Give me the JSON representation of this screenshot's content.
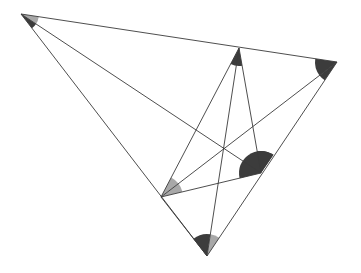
{
  "diagram": {
    "type": "geometric-construction",
    "vertices": [
      {
        "id": "A",
        "x": 21,
        "y": 14
      },
      {
        "id": "B",
        "x": 239,
        "y": 48
      },
      {
        "id": "C",
        "x": 337,
        "y": 62
      },
      {
        "id": "D",
        "x": 261,
        "y": 173
      },
      {
        "id": "E",
        "x": 161,
        "y": 197
      },
      {
        "id": "F",
        "x": 207,
        "y": 256
      }
    ],
    "edges": [
      [
        "A",
        "C"
      ],
      [
        "A",
        "F"
      ],
      [
        "A",
        "D"
      ],
      [
        "C",
        "F"
      ],
      [
        "C",
        "E"
      ],
      [
        "B",
        "E"
      ],
      [
        "B",
        "F"
      ],
      [
        "B",
        "D"
      ],
      [
        "E",
        "D"
      ],
      [
        "E",
        "F"
      ]
    ],
    "angle_marks": [
      {
        "vertex": "A",
        "between": [
          "C",
          "D"
        ],
        "shade": "light",
        "r": 18
      },
      {
        "vertex": "A",
        "between": [
          "D",
          "F"
        ],
        "shade": "dark",
        "r": 18
      },
      {
        "vertex": "B",
        "between": [
          "E",
          "D"
        ],
        "shade": "dark",
        "r": 18
      },
      {
        "vertex": "C",
        "between": [
          "A",
          "E"
        ],
        "shade": "dark",
        "r": 22
      },
      {
        "vertex": "C",
        "between": [
          "E",
          "F"
        ],
        "shade": "dark",
        "r": 22
      },
      {
        "vertex": "D",
        "between": [
          "B",
          "C"
        ],
        "shade": "dark",
        "r": 22
      },
      {
        "vertex": "D",
        "between": [
          "C",
          "E"
        ],
        "shade": "dark",
        "r": 22
      },
      {
        "vertex": "E",
        "between": [
          "B",
          "C"
        ],
        "shade": "light",
        "r": 22
      },
      {
        "vertex": "E",
        "between": [
          "C",
          "D"
        ],
        "shade": "light",
        "r": 22
      },
      {
        "vertex": "F",
        "between": [
          "E",
          "B"
        ],
        "shade": "dark",
        "r": 22
      },
      {
        "vertex": "F",
        "between": [
          "B",
          "C"
        ],
        "shade": "light",
        "r": 22
      }
    ],
    "colors": {
      "line": "#3a3a3a",
      "dark": "#3c3c3c",
      "light": "#a8a8a8",
      "background": "#ffffff"
    }
  }
}
